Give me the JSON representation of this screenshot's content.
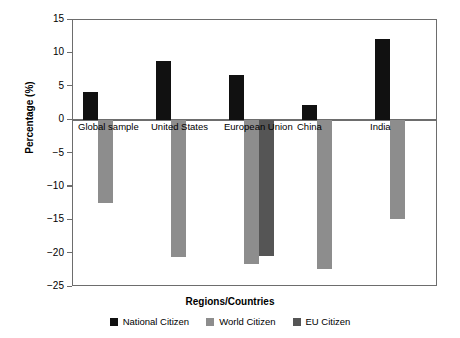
{
  "chart_data": {
    "type": "bar",
    "title": "",
    "xlabel": "Regions/Countries",
    "ylabel": "Percentage (%)",
    "categories": [
      "Global sample",
      "United States",
      "European Union",
      "China",
      "India"
    ],
    "series": [
      {
        "name": "National Citizen",
        "color": "#111111",
        "values": [
          4.2,
          8.8,
          6.8,
          2.2,
          12.2
        ]
      },
      {
        "name": "World Citizen",
        "color": "#8d8d8d",
        "values": [
          -12.4,
          -20.5,
          -21.5,
          -22.3,
          -14.8
        ]
      },
      {
        "name": "EU Citizen",
        "color": "#555555",
        "values": [
          null,
          null,
          -20.4,
          null,
          null
        ]
      }
    ],
    "ylim": [
      -25,
      15
    ],
    "yticks": [
      15,
      10,
      5,
      0,
      -5,
      -10,
      -15,
      -20,
      -25
    ],
    "ytick_labels": [
      "15",
      "10",
      "5",
      "0",
      "-5",
      "-10",
      "-15",
      "-20",
      "-25"
    ],
    "grid": false,
    "legend_position": "bottom"
  },
  "axis": {
    "y_title": "Percentage (%)",
    "x_title": "Regions/Countries",
    "y_tick_labels": [
      "15",
      "10",
      "5",
      "0",
      "−5",
      "−10",
      "−15",
      "−20",
      "−25"
    ]
  },
  "legend": {
    "items": [
      {
        "label": "National Citizen",
        "color": "#111111"
      },
      {
        "label": "World Citizen",
        "color": "#8d8d8d"
      },
      {
        "label": "EU Citizen",
        "color": "#555555"
      }
    ]
  },
  "categories": [
    {
      "label": "Global sample"
    },
    {
      "label": "United States"
    },
    {
      "label": "European Union"
    },
    {
      "label": "China"
    },
    {
      "label": "India"
    }
  ]
}
